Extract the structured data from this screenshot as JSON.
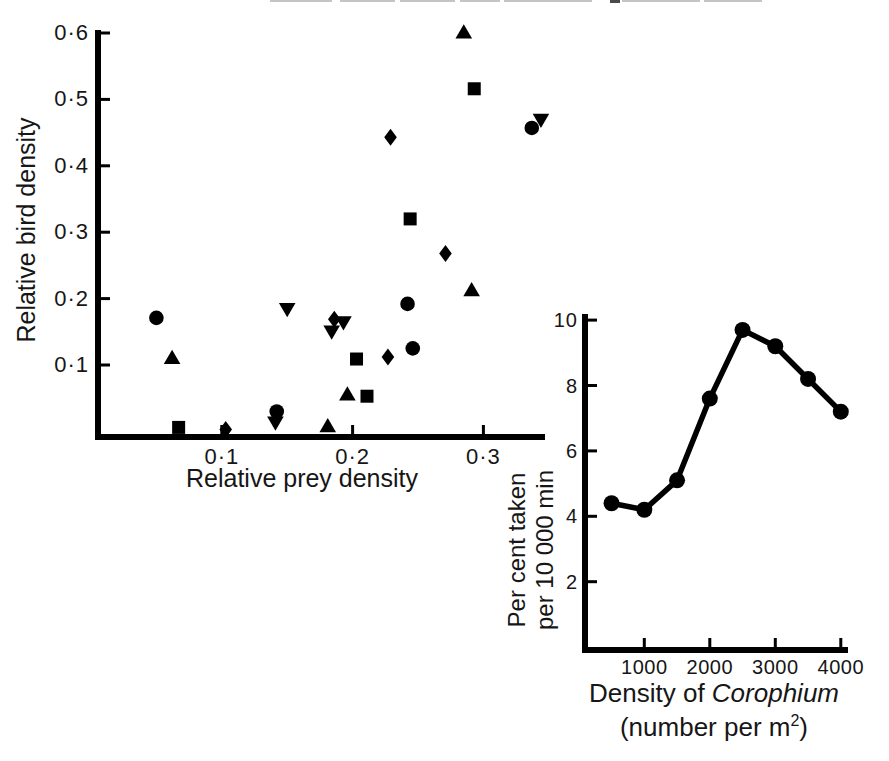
{
  "chart_data": [
    {
      "id": "bird-vs-prey-scatter",
      "type": "scatter",
      "title": "",
      "xlabel": "Relative prey density",
      "ylabel": "Relative bird density",
      "xlim": [
        0,
        0.347
      ],
      "ylim": [
        0,
        0.615
      ],
      "grid": false,
      "legend": "none",
      "color": "#000000",
      "x_ticks": [
        0.1,
        0.2,
        0.3
      ],
      "x_tick_labels": [
        "0·1",
        "0·2",
        "0·3"
      ],
      "y_ticks": [
        0.1,
        0.2,
        0.3,
        0.4,
        0.5,
        0.6
      ],
      "y_tick_labels": [
        "0·1",
        "0·2",
        "0·3",
        "0·4",
        "0·5",
        "0·6"
      ],
      "series": [
        {
          "name": "species-circle",
          "marker": "circle",
          "points": [
            [
              0.05,
              0.171
            ],
            [
              0.142,
              0.03
            ],
            [
              0.246,
              0.125
            ],
            [
              0.242,
              0.192
            ],
            [
              0.337,
              0.457
            ]
          ]
        },
        {
          "name": "species-square",
          "marker": "square",
          "points": [
            [
              0.067,
              0.006
            ],
            [
              0.203,
              0.109
            ],
            [
              0.211,
              0.053
            ],
            [
              0.244,
              0.32
            ],
            [
              0.293,
              0.516
            ]
          ]
        },
        {
          "name": "species-triangle-up",
          "marker": "triangle-up",
          "points": [
            [
              0.062,
              0.111
            ],
            [
              0.181,
              0.008
            ],
            [
              0.196,
              0.056
            ],
            [
              0.291,
              0.213
            ],
            [
              0.285,
              0.601
            ]
          ]
        },
        {
          "name": "species-triangle-down",
          "marker": "triangle-down",
          "points": [
            [
              0.141,
              0.013
            ],
            [
              0.15,
              0.184
            ],
            [
              0.184,
              0.15
            ],
            [
              0.193,
              0.164
            ],
            [
              0.344,
              0.469
            ]
          ]
        },
        {
          "name": "species-diamond",
          "marker": "diamond",
          "points": [
            [
              0.103,
              0.003
            ],
            [
              0.186,
              0.169
            ],
            [
              0.227,
              0.112
            ],
            [
              0.229,
              0.443
            ],
            [
              0.271,
              0.268
            ]
          ]
        }
      ]
    },
    {
      "id": "corophium-intake-line",
      "type": "line",
      "title": "",
      "ylabel_line1": "Per cent taken",
      "ylabel_line2": "per 10 000 min",
      "xlabel_prefix": "Density of ",
      "xlabel_italic": "Corophium",
      "xlabel2_pre": "(number per m",
      "xlabel2_sup": "2",
      "xlabel2_post": ")",
      "xlim": [
        0,
        4100
      ],
      "ylim": [
        0,
        10.2
      ],
      "grid": false,
      "legend": "none",
      "color": "#000000",
      "x_ticks": [
        1000,
        2000,
        3000,
        4000
      ],
      "x_tick_labels": [
        "1000",
        "2000",
        "3000",
        "4000"
      ],
      "y_ticks": [
        2,
        4,
        6,
        8,
        10
      ],
      "y_tick_labels": [
        "2",
        "4",
        "6",
        "8",
        "10"
      ],
      "x": [
        500,
        1000,
        1500,
        2000,
        2500,
        3000,
        3500,
        4000
      ],
      "y": [
        4.4,
        4.2,
        5.1,
        7.6,
        9.7,
        9.2,
        8.2,
        7.2
      ]
    }
  ]
}
